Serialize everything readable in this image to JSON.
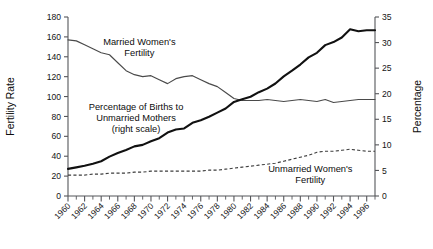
{
  "chart_data": {
    "type": "line",
    "title": "",
    "xlabel": "",
    "ylabel": "Fertility Rate",
    "y2label": "Percentage",
    "xlim": [
      1960,
      1997
    ],
    "ylim": [
      0,
      180
    ],
    "y2lim": [
      0,
      35
    ],
    "grid": false,
    "legend_position": "inline-annotations",
    "x_tick_step_minor": 1,
    "x_tick_step_major": 2,
    "x_ticklabels": [
      "1960",
      "1962",
      "1964",
      "1966",
      "1968",
      "1970",
      "1972",
      "1974",
      "1976",
      "1978",
      "1980",
      "1982",
      "1984",
      "1986",
      "1988",
      "1990",
      "1992",
      "1994",
      "1996"
    ],
    "y_ticklabels": [
      "0",
      "20",
      "40",
      "60",
      "80",
      "100",
      "120",
      "140",
      "160",
      "180"
    ],
    "y2_ticklabels": [
      "0",
      "5",
      "10",
      "15",
      "20",
      "25",
      "30",
      "35"
    ],
    "annotations": [
      {
        "name": "married-label",
        "text_lines": [
          "Married Women's",
          "Fertility"
        ],
        "x": 1968.6,
        "y": 152
      },
      {
        "name": "pct-label",
        "text_lines": [
          "Percentage of Births to",
          "Unmarried Mothers",
          "(right scale)"
        ],
        "x": 1968.2,
        "y": 86
      },
      {
        "name": "unmarried-label",
        "text_lines": [
          "Unmarried Women's",
          "Fertility"
        ],
        "x": 1989.2,
        "y": 24
      }
    ],
    "x": [
      1960,
      1961,
      1962,
      1963,
      1964,
      1965,
      1966,
      1967,
      1968,
      1969,
      1970,
      1971,
      1972,
      1973,
      1974,
      1975,
      1976,
      1977,
      1978,
      1979,
      1980,
      1981,
      1982,
      1983,
      1984,
      1985,
      1986,
      1987,
      1988,
      1989,
      1990,
      1991,
      1992,
      1993,
      1994,
      1995,
      1996,
      1997
    ],
    "series": [
      {
        "name": "Married Women's Fertility",
        "axis": "left",
        "style": "thin-solid",
        "values": [
          157,
          156,
          152,
          148,
          144,
          142,
          134,
          126,
          122,
          120,
          121,
          117,
          113,
          118,
          120,
          121,
          117,
          113,
          110,
          104,
          98,
          96,
          96,
          96,
          97,
          96,
          95,
          96,
          97,
          96,
          95,
          97,
          94,
          95,
          96,
          97,
          97,
          97
        ]
      },
      {
        "name": "Unmarried Women's Fertility",
        "axis": "left",
        "style": "dashed",
        "values": [
          21,
          21,
          21,
          22,
          22,
          23,
          23,
          23,
          24,
          24,
          25,
          25,
          25,
          25,
          25,
          25,
          25,
          26,
          26,
          27,
          28,
          29,
          30,
          31,
          32,
          33,
          35,
          37,
          39,
          41,
          44,
          45,
          45,
          46,
          47,
          46,
          45,
          45
        ]
      },
      {
        "name": "Percentage of Births to Unmarried Mothers",
        "axis": "right",
        "style": "bold-solid",
        "values": [
          5.3,
          5.6,
          5.9,
          6.3,
          6.8,
          7.7,
          8.4,
          9.0,
          9.7,
          10.0,
          10.7,
          11.3,
          12.4,
          13.0,
          13.2,
          14.3,
          14.8,
          15.5,
          16.3,
          17.1,
          18.4,
          18.9,
          19.4,
          20.3,
          21.0,
          22.0,
          23.4,
          24.5,
          25.7,
          27.1,
          28.0,
          29.5,
          30.1,
          31.0,
          32.6,
          32.2,
          32.4,
          32.4
        ]
      }
    ]
  }
}
